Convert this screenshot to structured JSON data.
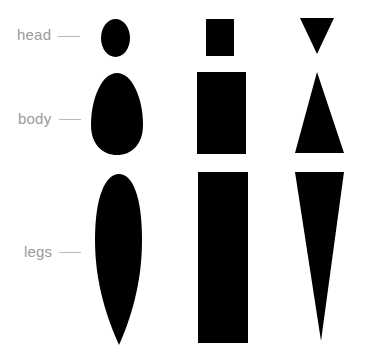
{
  "diagram": {
    "rows": [
      {
        "label": "head"
      },
      {
        "label": "body"
      },
      {
        "label": "legs"
      }
    ],
    "columns": [
      {
        "style": "rounded",
        "shapes": [
          "ellipse",
          "egg",
          "elongated-oval"
        ]
      },
      {
        "style": "rectangular",
        "shapes": [
          "square",
          "rectangle",
          "tall-rectangle"
        ]
      },
      {
        "style": "triangular",
        "shapes": [
          "down-triangle",
          "up-triangle",
          "long-down-triangle"
        ]
      }
    ],
    "colors": {
      "shape_fill": "#000000",
      "label": "#9a9a9a",
      "tick": "#b8b8b8",
      "background": "#ffffff"
    }
  }
}
